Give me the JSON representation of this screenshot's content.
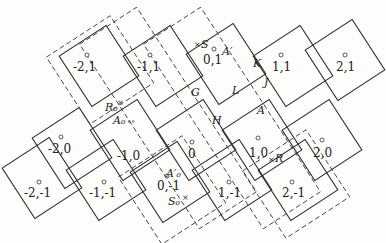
{
  "diagram": {
    "type": "tilted lattice of squares with dashed enclosing boxes",
    "rotation_deg": -33,
    "colors": {
      "line": "#333333",
      "background": "#fdfdfb"
    },
    "lattice_points": [
      {
        "label": "-2,1",
        "x": 87,
        "y": 66
      },
      {
        "label": "-1,1",
        "x": 150,
        "y": 66
      },
      {
        "label": "0,1",
        "x": 214,
        "y": 60
      },
      {
        "label": "1,1",
        "x": 281,
        "y": 66
      },
      {
        "label": "2,1",
        "x": 345,
        "y": 66
      },
      {
        "label": "-2,0",
        "x": 60,
        "y": 148
      },
      {
        "label": "-1,0",
        "x": 123,
        "y": 155
      },
      {
        "label": "0",
        "x": 192,
        "y": 155
      },
      {
        "label": "1,0",
        "x": 258,
        "y": 153
      },
      {
        "label": "2,0",
        "x": 322,
        "y": 153
      },
      {
        "label": "-2,-1",
        "x": 39,
        "y": 193
      },
      {
        "label": "-1,-1",
        "x": 103,
        "y": 193
      },
      {
        "label": "0,-1",
        "x": 167,
        "y": 186
      },
      {
        "label": "1,-1",
        "x": 229,
        "y": 193
      },
      {
        "label": "2,-1",
        "x": 292,
        "y": 193
      }
    ],
    "point_labels": [
      {
        "text": "S",
        "x": 201,
        "y": 46,
        "marker": "x"
      },
      {
        "text": "A′",
        "x": 222,
        "y": 55
      },
      {
        "text": "K",
        "x": 253,
        "y": 67
      },
      {
        "text": "J",
        "x": 264,
        "y": 86
      },
      {
        "text": "L",
        "x": 232,
        "y": 92
      },
      {
        "text": "G",
        "x": 191,
        "y": 95
      },
      {
        "text": "H",
        "x": 212,
        "y": 122
      },
      {
        "text": "R₀",
        "x": 106,
        "y": 109,
        "marker": "x"
      },
      {
        "text": "A₀",
        "x": 113,
        "y": 122,
        "marker": "oo"
      },
      {
        "text": "A",
        "x": 257,
        "y": 113
      },
      {
        "text": "R",
        "x": 275,
        "y": 161,
        "marker": "x"
      },
      {
        "text": "A′₀",
        "x": 166,
        "y": 175
      },
      {
        "text": "S₀",
        "x": 168,
        "y": 203,
        "marker": "x"
      }
    ]
  }
}
